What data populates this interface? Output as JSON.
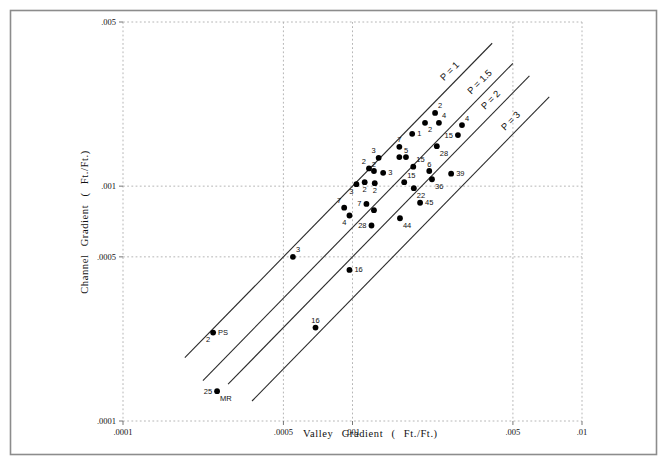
{
  "figure": {
    "border_color": "#8c8c8c",
    "background": "#ffffff"
  },
  "colors": {
    "point": "#000000",
    "line": "#2b2b2b",
    "grid": "#aeaeae",
    "tick": "#666666",
    "text": "#111111"
  },
  "chart_data": {
    "type": "scatter",
    "xlabel": "Valley Gradient ( Ft./Ft.)",
    "ylabel": "Channel Gradient ( Ft./Ft.)",
    "x_scale": "log",
    "y_scale": "log",
    "xlim": [
      0.0001,
      0.01
    ],
    "ylim": [
      0.0001,
      0.005
    ],
    "grid": "dashed",
    "x_ticks": [
      {
        "v": 0.0001,
        "label": ".0001"
      },
      {
        "v": 0.0005,
        "label": ".0005"
      },
      {
        "v": 0.001,
        "label": ".001"
      },
      {
        "v": 0.005,
        "label": ".005"
      },
      {
        "v": 0.01,
        "label": ".01"
      }
    ],
    "y_ticks": [
      {
        "v": 0.005,
        "label": ".005"
      },
      {
        "v": 0.001,
        "label": ".001"
      },
      {
        "v": 0.0005,
        "label": ".0005"
      },
      {
        "v": 0.0001,
        "label": ".0001"
      }
    ],
    "sinuosity_lines": [
      {
        "p": 1,
        "label": "P = 1",
        "x_start": 0.000186,
        "x_end": 0.00406,
        "label_x": 0.00271
      },
      {
        "p": 1.5,
        "label": "P = 1.5",
        "x_start": 0.000223,
        "x_end": 0.005,
        "label_x": 0.00366
      },
      {
        "p": 2,
        "label": "P = 2",
        "x_start": 0.000287,
        "x_end": 0.0059,
        "label_x": 0.00409
      },
      {
        "p": 3,
        "label": "P = 3",
        "x_start": 0.000365,
        "x_end": 0.0072,
        "label_x": 0.005
      }
    ],
    "points": [
      {
        "x": 0.00229,
        "y": 0.00205,
        "label": "2",
        "label_pos": "above-right"
      },
      {
        "x": 0.00238,
        "y": 0.00186,
        "label": "4",
        "label_pos": "above-right"
      },
      {
        "x": 0.00207,
        "y": 0.00186,
        "label": "2",
        "label_pos": "below-right"
      },
      {
        "x": 0.00182,
        "y": 0.00167,
        "label": "1",
        "label_pos": "right"
      },
      {
        "x": 0.003,
        "y": 0.00182,
        "label": "4",
        "label_pos": "above-right"
      },
      {
        "x": 0.00288,
        "y": 0.00165,
        "label": "15",
        "label_pos": "left"
      },
      {
        "x": 0.0016,
        "y": 0.00147,
        "label": "7",
        "label_pos": "above"
      },
      {
        "x": 0.00233,
        "y": 0.00148,
        "label": "28",
        "label_pos": "below-right"
      },
      {
        "x": 0.0013,
        "y": 0.00132,
        "label": "3",
        "label_pos": "above-left"
      },
      {
        "x": 0.00171,
        "y": 0.00133,
        "label": "5",
        "label_pos": "above"
      },
      {
        "x": 0.0016,
        "y": 0.00133,
        "label": "",
        "label_pos": ""
      },
      {
        "x": 0.00184,
        "y": 0.00121,
        "label": "15",
        "label_pos": "above-right"
      },
      {
        "x": 0.00118,
        "y": 0.00119,
        "label": "2",
        "label_pos": "above-left"
      },
      {
        "x": 0.00124,
        "y": 0.00116,
        "label": "2",
        "label_pos": "above"
      },
      {
        "x": 0.00136,
        "y": 0.00114,
        "label": "3",
        "label_pos": "right"
      },
      {
        "x": 0.00216,
        "y": 0.00116,
        "label": "6",
        "label_pos": "above"
      },
      {
        "x": 0.00222,
        "y": 0.00107,
        "label": "36",
        "label_pos": "below-right"
      },
      {
        "x": 0.00269,
        "y": 0.00113,
        "label": "39",
        "label_pos": "right"
      },
      {
        "x": 0.00168,
        "y": 0.00104,
        "label": "15",
        "label_pos": "above-right"
      },
      {
        "x": 0.00104,
        "y": 0.00102,
        "label": "3",
        "label_pos": "below-left"
      },
      {
        "x": 0.00113,
        "y": 0.00104,
        "label": "2",
        "label_pos": "below"
      },
      {
        "x": 0.00125,
        "y": 0.00103,
        "label": "2",
        "label_pos": "below"
      },
      {
        "x": 0.00185,
        "y": 0.00098,
        "label": "22",
        "label_pos": "below-right"
      },
      {
        "x": 0.00092,
        "y": 0.00081,
        "label": "7",
        "label_pos": "above-left"
      },
      {
        "x": 0.00115,
        "y": 0.00084,
        "label": "7",
        "label_pos": "left"
      },
      {
        "x": 0.00124,
        "y": 0.00079,
        "label": "",
        "label_pos": ""
      },
      {
        "x": 0.00197,
        "y": 0.00085,
        "label": "45",
        "label_pos": "right"
      },
      {
        "x": 0.00097,
        "y": 0.00075,
        "label": "4",
        "label_pos": "below-left"
      },
      {
        "x": 0.00161,
        "y": 0.00073,
        "label": "44",
        "label_pos": "below-right"
      },
      {
        "x": 0.00121,
        "y": 0.00068,
        "label": "28",
        "label_pos": "left"
      },
      {
        "x": 0.00055,
        "y": 0.0005,
        "label": "3",
        "label_pos": "above-right"
      },
      {
        "x": 0.00097,
        "y": 0.00044,
        "label": "16",
        "label_pos": "right"
      },
      {
        "x": 0.00069,
        "y": 0.00025,
        "label": "16",
        "label_pos": "above"
      },
      {
        "x": 0.000247,
        "y": 0.000238,
        "label": "PS",
        "label_pos": "right",
        "label2": "2",
        "label2_pos": "below-left"
      },
      {
        "x": 0.000257,
        "y": 0.000134,
        "label": "25",
        "label_pos": "left",
        "label2": "MR",
        "label2_pos": "below-right"
      }
    ]
  }
}
